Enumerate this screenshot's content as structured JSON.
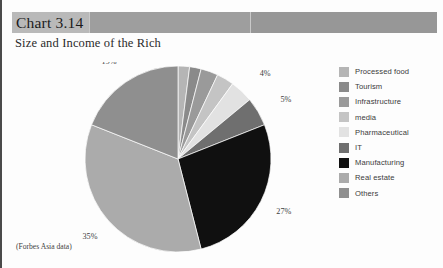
{
  "header": {
    "chart_number": "Chart 3.14",
    "band_color": "#b9b9b9",
    "band_fill_color": "#9e9e9e"
  },
  "subtitle": "Size and Income of the Rich",
  "footnote": "(Forbes Asia data)",
  "legend": {
    "items": [
      {
        "label": "Processed food",
        "color": "#b5b5b5"
      },
      {
        "label": "Tourism",
        "color": "#8a8a8a"
      },
      {
        "label": "Infrastructure",
        "color": "#9a9a9a"
      },
      {
        "label": "media",
        "color": "#c4c4c4"
      },
      {
        "label": "Pharmaceutical",
        "color": "#e2e2e2"
      },
      {
        "label": "IT",
        "color": "#6f6f6f"
      },
      {
        "label": "Manufacturing",
        "color": "#101010"
      },
      {
        "label": "Real estate",
        "color": "#ababab"
      },
      {
        "label": "Others",
        "color": "#8f8f8f"
      }
    ]
  },
  "chart_data": {
    "type": "pie",
    "title": "Chart 3.14",
    "subtitle": "Size and Income of the Rich",
    "source_note": "(Forbes Asia data)",
    "categories": [
      "Processed food",
      "Tourism",
      "Infrastructure",
      "media",
      "Pharmaceutical",
      "IT",
      "Manufacturing",
      "Real estate",
      "Others"
    ],
    "values": [
      2,
      2,
      3,
      3,
      4,
      5,
      27,
      35,
      19
    ],
    "value_unit": "%",
    "data_labels": [
      "2%",
      "2%",
      "3%",
      "3%",
      "4%",
      "5%",
      "27%",
      "35%",
      "19%"
    ],
    "colors": [
      "#b5b5b5",
      "#8a8a8a",
      "#9a9a9a",
      "#c4c4c4",
      "#e2e2e2",
      "#6f6f6f",
      "#101010",
      "#ababab",
      "#8f8f8f"
    ],
    "start_angle_deg": 0,
    "direction": "clockwise",
    "legend_position": "right",
    "grid": false,
    "xlabel": "",
    "ylabel": ""
  }
}
